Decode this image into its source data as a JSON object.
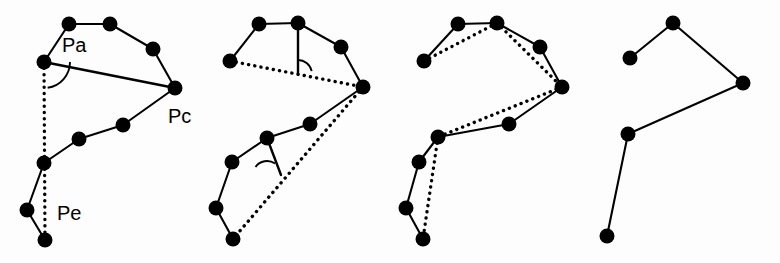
{
  "figure": {
    "background_color": "#fdfdfd",
    "ink_color": "#000000",
    "width": 780,
    "height": 263,
    "panel_count": 4
  },
  "labels": {
    "pa": "Pa",
    "pc": "Pc",
    "pe": "Pe"
  },
  "label_positions": {
    "pa": {
      "x": 62,
      "y": 47
    },
    "pc": {
      "x": 168,
      "y": 118
    },
    "pe": {
      "x": 57,
      "y": 215
    }
  },
  "panels": [
    {
      "id": "panel-original",
      "name": "original-polyline-with-anchors",
      "vertices": [
        {
          "id": "v0",
          "x": 69,
          "y": 24
        },
        {
          "id": "v1",
          "x": 110,
          "y": 24
        },
        {
          "id": "v2",
          "x": 153,
          "y": 49
        },
        {
          "id": "v3",
          "x": 175,
          "y": 88
        },
        {
          "id": "v4",
          "x": 123,
          "y": 125
        },
        {
          "id": "v5",
          "x": 79,
          "y": 139
        },
        {
          "id": "v6",
          "x": 44,
          "y": 163
        },
        {
          "id": "v7",
          "x": 27,
          "y": 210
        },
        {
          "id": "v8",
          "x": 45,
          "y": 240
        },
        {
          "id": "v9",
          "x": 44,
          "y": 62
        }
      ],
      "edges": [
        [
          "v9",
          "v0"
        ],
        [
          "v0",
          "v1"
        ],
        [
          "v1",
          "v2"
        ],
        [
          "v2",
          "v3"
        ],
        [
          "v3",
          "v4"
        ],
        [
          "v4",
          "v5"
        ],
        [
          "v5",
          "v6"
        ],
        [
          "v6",
          "v7"
        ],
        [
          "v7",
          "v8"
        ]
      ],
      "dotted_chords": [
        [
          "v9",
          "v8"
        ]
      ],
      "solid_chords": [
        [
          "v9",
          "v3"
        ]
      ],
      "angle_arcs": [
        {
          "cx": 44,
          "cy": 62,
          "radius": 26,
          "start_deg": 0,
          "end_deg": 82
        }
      ],
      "stems": []
    },
    {
      "id": "panel-error-measure",
      "name": "perpendicular-error-measurement",
      "vertices": [
        {
          "id": "v0",
          "x": 259,
          "y": 24
        },
        {
          "id": "v1",
          "x": 298,
          "y": 23
        },
        {
          "id": "v2",
          "x": 341,
          "y": 47
        },
        {
          "id": "v3",
          "x": 363,
          "y": 87
        },
        {
          "id": "v4",
          "x": 310,
          "y": 124
        },
        {
          "id": "v5",
          "x": 267,
          "y": 138
        },
        {
          "id": "v6",
          "x": 232,
          "y": 162
        },
        {
          "id": "v7",
          "x": 216,
          "y": 208
        },
        {
          "id": "v8",
          "x": 233,
          "y": 239
        },
        {
          "id": "v9",
          "x": 230,
          "y": 61
        }
      ],
      "edges": [
        [
          "v9",
          "v0"
        ],
        [
          "v0",
          "v1"
        ],
        [
          "v1",
          "v2"
        ],
        [
          "v2",
          "v3"
        ],
        [
          "v3",
          "v4"
        ],
        [
          "v4",
          "v5"
        ],
        [
          "v5",
          "v6"
        ],
        [
          "v6",
          "v7"
        ],
        [
          "v7",
          "v8"
        ]
      ],
      "dotted_chords": [
        [
          "v9",
          "v3"
        ],
        [
          "v3",
          "v8"
        ]
      ],
      "solid_chords": [],
      "angle_arcs": [
        {
          "cx": 298,
          "cy": 74,
          "radius": 14,
          "start_deg": 268,
          "end_deg": 348
        },
        {
          "cx": 267,
          "cy": 175,
          "radius": 14,
          "start_deg": 215,
          "end_deg": 305
        }
      ],
      "stems": [
        {
          "x1": 298,
          "y1": 23,
          "x2": 298,
          "y2": 74
        },
        {
          "x1": 267,
          "y1": 138,
          "x2": 281,
          "y2": 175
        }
      ]
    },
    {
      "id": "panel-chords-overlay",
      "name": "candidate-chords-overlay",
      "vertices": [
        {
          "id": "v0",
          "x": 458,
          "y": 24
        },
        {
          "id": "v1",
          "x": 497,
          "y": 23
        },
        {
          "id": "v2",
          "x": 540,
          "y": 47
        },
        {
          "id": "v3",
          "x": 562,
          "y": 87
        },
        {
          "id": "v4",
          "x": 509,
          "y": 124
        },
        {
          "id": "v5",
          "x": 438,
          "y": 137
        },
        {
          "id": "v6",
          "x": 419,
          "y": 162
        },
        {
          "id": "v7",
          "x": 406,
          "y": 208
        },
        {
          "id": "v8",
          "x": 423,
          "y": 239
        },
        {
          "id": "v9",
          "x": 424,
          "y": 61
        }
      ],
      "edges": [
        [
          "v9",
          "v0"
        ],
        [
          "v0",
          "v1"
        ],
        [
          "v1",
          "v2"
        ],
        [
          "v2",
          "v3"
        ],
        [
          "v3",
          "v4"
        ],
        [
          "v4",
          "v5"
        ],
        [
          "v5",
          "v6"
        ],
        [
          "v6",
          "v7"
        ],
        [
          "v7",
          "v8"
        ]
      ],
      "dotted_chords": [
        [
          "v9",
          "v1"
        ],
        [
          "v1",
          "v3"
        ],
        [
          "v3",
          "v5"
        ],
        [
          "v5",
          "v8"
        ]
      ],
      "solid_chords": [],
      "angle_arcs": [],
      "stems": []
    },
    {
      "id": "panel-simplified",
      "name": "simplified-polyline-result",
      "vertices": [
        {
          "id": "v0",
          "x": 630,
          "y": 58
        },
        {
          "id": "v1",
          "x": 673,
          "y": 23
        },
        {
          "id": "v2",
          "x": 743,
          "y": 83
        },
        {
          "id": "v3",
          "x": 628,
          "y": 134
        },
        {
          "id": "v4",
          "x": 607,
          "y": 236
        }
      ],
      "edges": [
        [
          "v0",
          "v1"
        ],
        [
          "v1",
          "v2"
        ],
        [
          "v2",
          "v3"
        ],
        [
          "v3",
          "v4"
        ]
      ],
      "dotted_chords": [],
      "solid_chords": [],
      "angle_arcs": [],
      "stems": []
    }
  ],
  "style": {
    "vertex_radius": 7.5,
    "edge_width": 2.1,
    "dotted_width": 3.4
  }
}
